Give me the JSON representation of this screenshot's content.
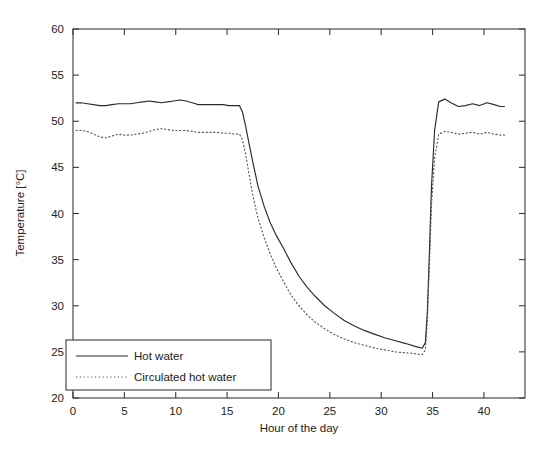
{
  "chart_data": {
    "type": "line",
    "title": "",
    "xlabel": "Hour of the day",
    "ylabel": "Temperature [°C]",
    "xlim": [
      0,
      44
    ],
    "ylim": [
      20,
      60
    ],
    "xticks": [
      0,
      5,
      10,
      15,
      20,
      25,
      30,
      35,
      40
    ],
    "yticks": [
      20,
      25,
      30,
      35,
      40,
      45,
      50,
      55,
      60
    ],
    "xtick_labels": [
      "0",
      "5",
      "10",
      "15",
      "20",
      "25",
      "30",
      "35",
      "40"
    ],
    "ytick_labels": [
      "20",
      "25",
      "30",
      "35",
      "40",
      "45",
      "50",
      "55",
      "60"
    ],
    "grid": false,
    "legend_position": "lower left",
    "series": [
      {
        "name": "Hot water",
        "style": "solid",
        "color": "#2b2b2b",
        "x": [
          0.3,
          0.8,
          1.4,
          2.0,
          2.6,
          3.2,
          3.8,
          4.4,
          5.0,
          5.6,
          6.2,
          6.8,
          7.4,
          8.0,
          8.6,
          9.2,
          9.8,
          10.4,
          11.0,
          11.6,
          12.2,
          12.8,
          13.4,
          14.0,
          14.6,
          15.2,
          15.8,
          16.2,
          16.5,
          16.8,
          17.1,
          17.5,
          18.0,
          18.6,
          19.2,
          19.8,
          20.5,
          21.2,
          22.0,
          22.8,
          23.6,
          24.5,
          25.4,
          26.4,
          27.4,
          28.4,
          29.4,
          30.4,
          31.4,
          32.4,
          33.3,
          34.0,
          34.3,
          34.5,
          34.7,
          34.9,
          35.2,
          35.6,
          36.2,
          36.8,
          37.5,
          38.2,
          38.9,
          39.6,
          40.3,
          41.0,
          41.6,
          42.0
        ],
        "y": [
          52.0,
          52.0,
          51.9,
          51.8,
          51.7,
          51.7,
          51.8,
          51.9,
          51.9,
          51.9,
          52.0,
          52.1,
          52.2,
          52.1,
          52.0,
          52.1,
          52.2,
          52.3,
          52.2,
          52.0,
          51.8,
          51.8,
          51.8,
          51.8,
          51.8,
          51.7,
          51.7,
          51.7,
          51.0,
          49.5,
          47.8,
          45.6,
          43.0,
          40.8,
          39.0,
          37.6,
          36.2,
          34.7,
          33.2,
          32.0,
          31.0,
          30.0,
          29.2,
          28.4,
          27.8,
          27.3,
          26.9,
          26.5,
          26.2,
          25.9,
          25.6,
          25.4,
          26.0,
          29.5,
          36.0,
          43.0,
          49.0,
          52.1,
          52.4,
          52.0,
          51.6,
          51.7,
          51.9,
          51.7,
          52.0,
          51.8,
          51.6,
          51.6
        ],
        "legend_label": "Hot water"
      },
      {
        "name": "Circulated hot water",
        "style": "dotted",
        "color": "#555555",
        "x": [
          0.3,
          0.8,
          1.4,
          2.0,
          2.6,
          3.2,
          3.8,
          4.4,
          5.0,
          5.6,
          6.2,
          6.8,
          7.4,
          8.0,
          8.6,
          9.2,
          9.8,
          10.4,
          11.0,
          11.6,
          12.2,
          12.8,
          13.4,
          14.0,
          14.6,
          15.2,
          15.8,
          16.2,
          16.5,
          16.8,
          17.1,
          17.5,
          18.0,
          18.6,
          19.2,
          19.8,
          20.5,
          21.2,
          22.0,
          22.8,
          23.6,
          24.5,
          25.4,
          26.4,
          27.4,
          28.4,
          29.4,
          30.4,
          31.4,
          32.4,
          33.3,
          34.0,
          34.3,
          34.5,
          34.7,
          34.9,
          35.2,
          35.6,
          36.2,
          36.8,
          37.5,
          38.2,
          38.9,
          39.6,
          40.3,
          41.0,
          41.6,
          42.0
        ],
        "y": [
          49.0,
          49.0,
          48.9,
          48.6,
          48.3,
          48.2,
          48.4,
          48.6,
          48.5,
          48.5,
          48.6,
          48.7,
          48.9,
          49.1,
          49.2,
          49.1,
          49.0,
          49.0,
          49.0,
          48.9,
          48.8,
          48.8,
          48.8,
          48.8,
          48.7,
          48.7,
          48.6,
          48.6,
          48.0,
          46.5,
          44.5,
          42.0,
          39.5,
          37.4,
          35.6,
          34.1,
          32.6,
          31.2,
          30.0,
          29.0,
          28.2,
          27.5,
          26.9,
          26.4,
          26.0,
          25.7,
          25.4,
          25.2,
          25.0,
          24.9,
          24.8,
          24.7,
          25.2,
          28.5,
          34.5,
          41.0,
          46.0,
          48.6,
          48.9,
          48.8,
          48.6,
          48.7,
          48.8,
          48.6,
          48.8,
          48.6,
          48.5,
          48.5
        ],
        "legend_label": "Circulated hot water"
      }
    ]
  },
  "legend": {
    "items": [
      {
        "label": "Hot water",
        "style": "solid"
      },
      {
        "label": "Circulated hot water",
        "style": "dotted"
      }
    ]
  },
  "axes": {
    "x_title": "Hour of the day",
    "y_title": "Temperature [°C]"
  },
  "colors": {
    "axis": "#3a3a3a",
    "series_solid": "#2b2b2b",
    "series_dotted": "#555555",
    "background": "#ffffff",
    "text": "#222222"
  }
}
